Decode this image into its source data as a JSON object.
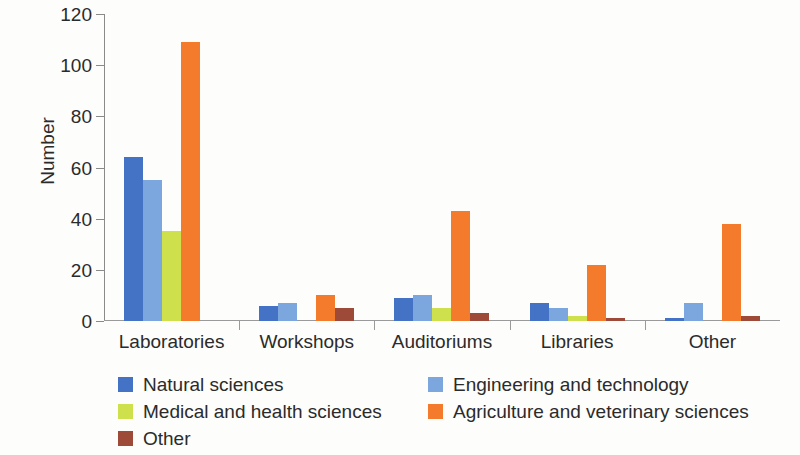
{
  "chart_data": {
    "type": "bar",
    "title": "",
    "xlabel": "",
    "ylabel": "Number",
    "ylim": [
      0,
      120
    ],
    "yticks": [
      0,
      20,
      40,
      60,
      80,
      100,
      120
    ],
    "grid": false,
    "legend_position": "bottom",
    "categories": [
      "Laboratories",
      "Workshops",
      "Auditoriums",
      "Libraries",
      "Other"
    ],
    "series": [
      {
        "name": "Natural sciences",
        "color": "#4472C4",
        "values": [
          64,
          6,
          9,
          7,
          1
        ]
      },
      {
        "name": "Engineering and technology",
        "color": "#7BA7DE",
        "values": [
          55,
          7,
          10,
          5,
          7
        ]
      },
      {
        "name": "Medical and health sciences",
        "color": "#CEE04B",
        "values": [
          35,
          0,
          5,
          2,
          0
        ]
      },
      {
        "name": "Agriculture and veterinary sciences",
        "color": "#F47B2C",
        "values": [
          109,
          10,
          43,
          22,
          38
        ]
      },
      {
        "name": "Other",
        "color": "#9E4A38",
        "values": [
          0,
          5,
          3,
          1,
          2
        ]
      }
    ]
  },
  "axis": {
    "y_title": "Number",
    "y_tick_labels": [
      "0",
      "20",
      "40",
      "60",
      "80",
      "100",
      "120"
    ],
    "x_tick_labels": [
      "Laboratories",
      "Workshops",
      "Auditoriums",
      "Libraries",
      "Other"
    ]
  },
  "legend": {
    "entries": [
      {
        "label": "Natural sciences",
        "color": "#4472C4"
      },
      {
        "label": "Engineering and technology",
        "color": "#7BA7DE"
      },
      {
        "label": "Medical and health sciences",
        "color": "#CEE04B"
      },
      {
        "label": "Agriculture and veterinary sciences",
        "color": "#F47B2C"
      },
      {
        "label": "Other",
        "color": "#9E4A38"
      }
    ]
  }
}
